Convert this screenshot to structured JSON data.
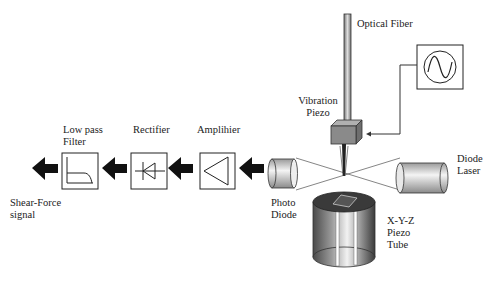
{
  "diagram": {
    "labels": {
      "optical_fiber": "Optical Fiber",
      "vibration_piezo_1": "Vibration",
      "vibration_piezo_2": "Piezo",
      "diode_laser_1": "Diode",
      "diode_laser_2": "Laser",
      "photo_diode_1": "Photo",
      "photo_diode_2": "Diode",
      "piezo_tube_1": "X-Y-Z",
      "piezo_tube_2": "Piezo",
      "piezo_tube_3": "Tube",
      "amplifier": "Amplihier",
      "rectifier": "Rectifier",
      "low_pass_1": "Low pass",
      "low_pass_2": "Filter",
      "output_1": "Shear-Force",
      "output_2": "signal"
    },
    "icons": {
      "oscillator": "sine-wave-icon",
      "amplifier": "triangle-amplifier-icon",
      "rectifier": "diode-symbol-icon",
      "filter": "low-pass-curve-icon",
      "arrows": "left-block-arrow-icon"
    },
    "colors": {
      "line": "#222222",
      "arrow": "#111111",
      "piezo_block": "#8a8a8a"
    }
  }
}
